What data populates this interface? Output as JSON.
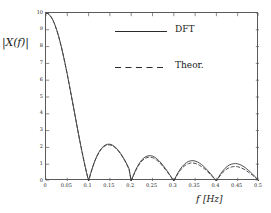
{
  "chart_data": {
    "type": "line",
    "title": "",
    "xlabel": "f  [Hz]",
    "ylabel": "|X(f)|",
    "xlim": [
      0,
      0.5
    ],
    "ylim": [
      0,
      10
    ],
    "grid": false,
    "legend_position": "upper-center",
    "x_ticks": [
      "0",
      "0.05",
      "0.1",
      "0.15",
      "0.2",
      "0.25",
      "0.3",
      "0.35",
      "0.4",
      "0.45",
      "0.5"
    ],
    "x_tick_values": [
      0,
      0.05,
      0.1,
      0.15,
      0.2,
      0.25,
      0.3,
      0.35,
      0.4,
      0.45,
      0.5
    ],
    "y_ticks": [
      "0",
      "1",
      "2",
      "3",
      "4",
      "5",
      "6",
      "7",
      "8",
      "9",
      "10"
    ],
    "y_tick_values": [
      0,
      1,
      2,
      3,
      4,
      5,
      6,
      7,
      8,
      9,
      10
    ],
    "series": [
      {
        "name": "DFT",
        "style": "solid",
        "color": "#3c3c3c",
        "x": [
          0,
          0.005,
          0.01,
          0.015,
          0.02,
          0.025,
          0.03,
          0.035,
          0.04,
          0.045,
          0.05,
          0.055,
          0.06,
          0.065,
          0.07,
          0.075,
          0.08,
          0.085,
          0.09,
          0.095,
          0.1,
          0.105,
          0.11,
          0.115,
          0.12,
          0.125,
          0.13,
          0.135,
          0.14,
          0.145,
          0.15,
          0.155,
          0.16,
          0.165,
          0.17,
          0.175,
          0.18,
          0.185,
          0.19,
          0.195,
          0.2,
          0.205,
          0.21,
          0.215,
          0.22,
          0.225,
          0.23,
          0.235,
          0.24,
          0.245,
          0.25,
          0.255,
          0.26,
          0.265,
          0.27,
          0.275,
          0.28,
          0.285,
          0.29,
          0.295,
          0.3,
          0.305,
          0.31,
          0.315,
          0.32,
          0.325,
          0.33,
          0.335,
          0.34,
          0.345,
          0.35,
          0.355,
          0.36,
          0.365,
          0.37,
          0.375,
          0.38,
          0.385,
          0.39,
          0.395,
          0.4,
          0.405,
          0.41,
          0.415,
          0.42,
          0.425,
          0.43,
          0.435,
          0.44,
          0.445,
          0.45,
          0.455,
          0.46,
          0.465,
          0.47,
          0.475,
          0.48,
          0.485,
          0.49,
          0.495,
          0.5
        ],
        "y": [
          10.0,
          9.96,
          9.84,
          9.64,
          9.36,
          9.0,
          8.58,
          8.09,
          7.55,
          6.96,
          6.34,
          5.68,
          5.01,
          4.33,
          3.65,
          2.97,
          2.31,
          1.68,
          1.08,
          0.52,
          0.0,
          0.46,
          0.87,
          1.22,
          1.51,
          1.75,
          1.93,
          2.07,
          2.15,
          2.19,
          2.19,
          2.15,
          2.07,
          1.96,
          1.82,
          1.65,
          1.45,
          1.23,
          0.99,
          0.72,
          0.0,
          0.33,
          0.63,
          0.88,
          1.09,
          1.26,
          1.38,
          1.46,
          1.5,
          1.51,
          1.48,
          1.42,
          1.33,
          1.21,
          1.07,
          0.92,
          0.75,
          0.58,
          0.39,
          0.2,
          0.0,
          0.26,
          0.5,
          0.7,
          0.87,
          1.0,
          1.1,
          1.17,
          1.2,
          1.21,
          1.19,
          1.14,
          1.07,
          0.98,
          0.87,
          0.75,
          0.61,
          0.47,
          0.32,
          0.16,
          0.0,
          0.22,
          0.43,
          0.6,
          0.75,
          0.86,
          0.95,
          1.0,
          1.03,
          1.04,
          1.02,
          0.98,
          0.92,
          0.84,
          0.75,
          0.64,
          0.53,
          0.41,
          0.28,
          0.14,
          0.0
        ]
      },
      {
        "name": "Theor.",
        "style": "dashed",
        "color": "#3c3c3c",
        "x": [
          0,
          0.005,
          0.01,
          0.015,
          0.02,
          0.025,
          0.03,
          0.035,
          0.04,
          0.045,
          0.05,
          0.055,
          0.06,
          0.065,
          0.07,
          0.075,
          0.08,
          0.085,
          0.09,
          0.095,
          0.1,
          0.105,
          0.11,
          0.115,
          0.12,
          0.125,
          0.13,
          0.135,
          0.14,
          0.145,
          0.15,
          0.155,
          0.16,
          0.165,
          0.17,
          0.175,
          0.18,
          0.185,
          0.19,
          0.195,
          0.2,
          0.205,
          0.21,
          0.215,
          0.22,
          0.225,
          0.23,
          0.235,
          0.24,
          0.245,
          0.25,
          0.255,
          0.26,
          0.265,
          0.27,
          0.275,
          0.28,
          0.285,
          0.29,
          0.295,
          0.3,
          0.305,
          0.31,
          0.315,
          0.32,
          0.325,
          0.33,
          0.335,
          0.34,
          0.345,
          0.35,
          0.355,
          0.36,
          0.365,
          0.37,
          0.375,
          0.38,
          0.385,
          0.39,
          0.395,
          0.4,
          0.405,
          0.41,
          0.415,
          0.42,
          0.425,
          0.43,
          0.435,
          0.44,
          0.445,
          0.45,
          0.455,
          0.46,
          0.465,
          0.47,
          0.475,
          0.48,
          0.485,
          0.49,
          0.495,
          0.5
        ],
        "y": [
          10.0,
          9.96,
          9.84,
          9.64,
          9.36,
          9.0,
          8.58,
          8.09,
          7.55,
          6.96,
          6.34,
          5.68,
          5.01,
          4.33,
          3.65,
          2.97,
          2.31,
          1.68,
          1.08,
          0.52,
          0.0,
          0.46,
          0.86,
          1.21,
          1.49,
          1.72,
          1.9,
          2.03,
          2.11,
          2.15,
          2.15,
          2.11,
          2.03,
          1.92,
          1.78,
          1.61,
          1.42,
          1.2,
          0.96,
          0.7,
          0.0,
          0.31,
          0.59,
          0.83,
          1.03,
          1.19,
          1.3,
          1.38,
          1.41,
          1.42,
          1.39,
          1.33,
          1.24,
          1.13,
          1.0,
          0.85,
          0.69,
          0.53,
          0.36,
          0.18,
          0.0,
          0.23,
          0.45,
          0.63,
          0.78,
          0.9,
          0.98,
          1.04,
          1.07,
          1.07,
          1.05,
          1.01,
          0.94,
          0.86,
          0.77,
          0.66,
          0.54,
          0.41,
          0.28,
          0.14,
          0.0,
          0.19,
          0.36,
          0.51,
          0.63,
          0.72,
          0.79,
          0.83,
          0.86,
          0.86,
          0.85,
          0.81,
          0.76,
          0.7,
          0.62,
          0.53,
          0.44,
          0.34,
          0.23,
          0.12,
          0.0
        ]
      }
    ],
    "legend": [
      {
        "label": "DFT",
        "style": "solid"
      },
      {
        "label": "Theor.",
        "style": "dashed"
      }
    ]
  },
  "axes": {
    "ylabel_text": "|X(f)|",
    "xlabel_symbol": "f",
    "xlabel_unit": "[Hz]"
  }
}
